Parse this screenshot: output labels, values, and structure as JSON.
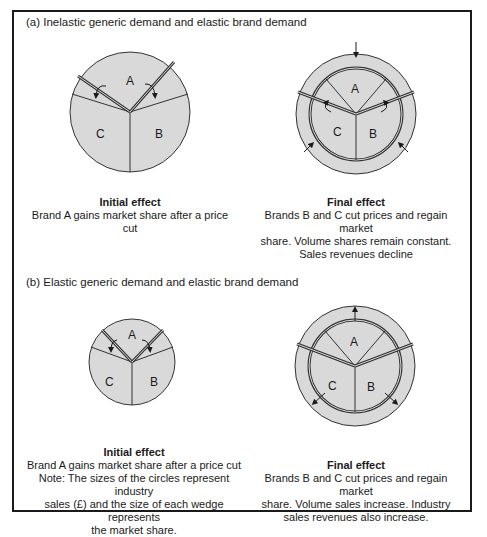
{
  "panel_a": {
    "title": "(a) Inelastic generic demand and elastic brand demand",
    "initial": {
      "heading": "Initial effect",
      "line1": "Brand A gains market share after a price",
      "line2": "cut"
    },
    "final": {
      "heading": "Final effect",
      "line1": "Brands B and C cut prices and regain market",
      "line2": "share. Volume shares remain constant.",
      "line3": "Sales revenues decline"
    }
  },
  "panel_b": {
    "title": "(b) Elastic generic demand and elastic brand demand",
    "initial": {
      "heading": "Initial effect",
      "line1": "Brand A gains market share after a price cut",
      "line2": "Note: The sizes of the circles represent industry",
      "line3": "sales (£) and the size of each wedge represents",
      "line4": "the market share."
    },
    "final": {
      "heading": "Final effect",
      "line1": "Brands B and C cut prices and regain market",
      "line2": "share. Volume sales increase. Industry",
      "line3": "sales revenues also increase."
    }
  },
  "wedge_labels": {
    "a": "A",
    "b": "B",
    "c": "C"
  },
  "colors": {
    "fill": "#d9d9d9",
    "stroke": "#333333",
    "border": "#1a1a1a"
  }
}
